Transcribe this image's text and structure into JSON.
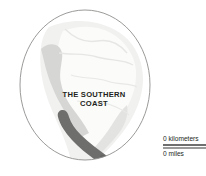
{
  "map": {
    "region_label": {
      "line1": "THE SOUTHERN",
      "line2": "COAST"
    },
    "colors": {
      "background": "#ffffff",
      "ocean": "#ffffff",
      "land_fill": "#f2f2f1",
      "land_interior": "#fafafa",
      "coast_shade": "#d5d6d4",
      "highlight_region": "#6d6e6c",
      "circle_outline": "#8e8f8d",
      "label_text": "#231f20",
      "scale_rule_km": "#6f6f6f",
      "scale_rule_mi": "#9a9a9a"
    }
  },
  "scale": {
    "kilometers_label": "0 kilometers",
    "miles_label": "0 miles"
  }
}
